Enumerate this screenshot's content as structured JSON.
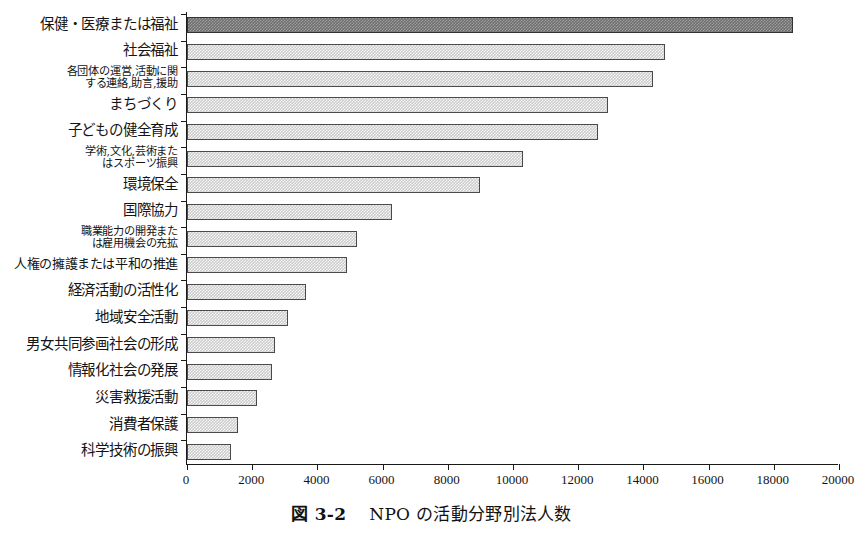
{
  "figure": {
    "caption_number": "図 3-2",
    "caption_text": "NPO の活動分野別法人数"
  },
  "axis": {
    "x_ticks": [
      "0",
      "2000",
      "4000",
      "6000",
      "8000",
      "10000",
      "12000",
      "14000",
      "16000",
      "18000",
      "20000"
    ],
    "x_min": 0,
    "x_max": 20000,
    "x_step": 2000
  },
  "colors": {
    "highlight_bar": "#6e6e6e",
    "normal_bar": "#cccccc",
    "bar_border": "#4a4a4a",
    "axis": "#1a1a1a",
    "text": "#141414",
    "background": "#ffffff"
  },
  "chart_data": {
    "type": "bar",
    "orientation": "horizontal",
    "title": "NPO の活動分野別法人数",
    "xlabel": "",
    "ylabel": "",
    "xlim": [
      0,
      20000
    ],
    "xticks": [
      0,
      2000,
      4000,
      6000,
      8000,
      10000,
      12000,
      14000,
      16000,
      18000,
      20000
    ],
    "grid": false,
    "legend": false,
    "categories": [
      "保健・医療または福祉",
      "社会福祉",
      "各団体の運営,活動に関\nする連絡,助言,援助",
      "まちづくり",
      "子どもの健全育成",
      "学術,文化,芸術また\nはスポーツ振興",
      "環境保全",
      "国際協力",
      "職業能力の開発また\nは雇用機会の充拡",
      "人権の擁護または平和の推進",
      "経済活動の活性化",
      "地域安全活動",
      "男女共同参画社会の形成",
      "情報化社会の発展",
      "災害救援活動",
      "消費者保護",
      "科学技術の振興"
    ],
    "values": [
      18600,
      14650,
      14300,
      12900,
      12600,
      10300,
      9000,
      6300,
      5200,
      4900,
      3650,
      3100,
      2700,
      2600,
      2150,
      1550,
      1350
    ],
    "highlight_index": 0
  }
}
